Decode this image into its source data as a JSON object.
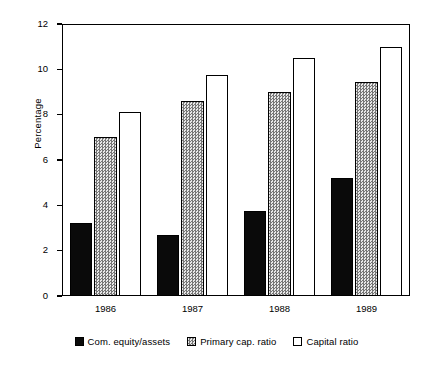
{
  "chart_data": {
    "type": "bar",
    "title": "",
    "subtitle": "",
    "xlabel": "",
    "ylabel": "Percentage",
    "categories": [
      "1986",
      "1987",
      "1988",
      "1989"
    ],
    "series": [
      {
        "name": "Com. equity/assets",
        "color": "#0a0a0a",
        "fill": "solid-black",
        "values": [
          3.2,
          2.7,
          3.75,
          5.2
        ]
      },
      {
        "name": "Primary cap. ratio",
        "color": "#808080",
        "fill": "dithered-gray",
        "values": [
          7.0,
          8.6,
          9.0,
          9.45
        ]
      },
      {
        "name": "Capital ratio",
        "color": "#ffffff",
        "fill": "white-outline",
        "values": [
          8.1,
          9.75,
          10.5,
          11.0
        ]
      }
    ],
    "ylim": [
      0,
      12
    ],
    "yticks": [
      0,
      2,
      4,
      6,
      8,
      10,
      12
    ],
    "ytick_labels": [
      "0",
      "2",
      "4",
      "6",
      "8",
      "10",
      "12"
    ],
    "grid": false,
    "legend_position": "bottom",
    "frame": "box"
  }
}
